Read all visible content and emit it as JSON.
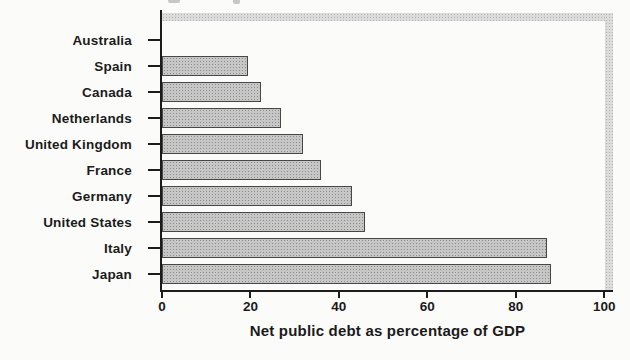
{
  "chart_data": {
    "type": "bar",
    "orientation": "horizontal",
    "title": "",
    "xlabel": "Net public debt as percentage of GDP",
    "ylabel": "",
    "categories": [
      "Australia",
      "Spain",
      "Canada",
      "Netherlands",
      "United Kingdom",
      "France",
      "Germany",
      "United States",
      "Italy",
      "Japan"
    ],
    "values": [
      0,
      19.5,
      22.5,
      27,
      32,
      36,
      43,
      46,
      87,
      88
    ],
    "xlim": [
      0,
      102
    ],
    "xticks": [
      0,
      20,
      40,
      60,
      80,
      100
    ],
    "grid": false,
    "legend": "none",
    "bar_fill": "#c6c6c6",
    "bar_border": "#474747",
    "frame_fill": "#dcdcdc",
    "axis_color": "#1c1c1c",
    "text_color": "#1b1b1b",
    "background": "#fbfbfa"
  }
}
